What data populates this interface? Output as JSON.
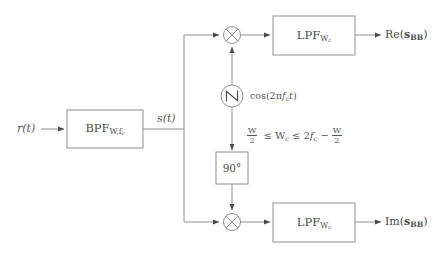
{
  "diagram": {
    "background_color": "#ffffff",
    "line_color": "#808080",
    "text_color": "#4a4a4a"
  },
  "inputs": {
    "r_label_main": "r",
    "r_label_arg": "(t)"
  },
  "blocks": {
    "bpf": {
      "name": "BPF",
      "subscript": "W,f",
      "sub_subscript": "c"
    },
    "phase_shift": {
      "label": "90°"
    },
    "lpf_upper": {
      "name": "LPF",
      "subscript": "W",
      "sub_subscript": "c"
    },
    "lpf_lower": {
      "name": "LPF",
      "subscript": "W",
      "sub_subscript": "c"
    }
  },
  "signals": {
    "s_of_t_main": "s",
    "s_of_t_arg": "(t)"
  },
  "oscillator": {
    "icon": "sine-wave-icon",
    "label_pre": "cos(2π",
    "label_f": "f",
    "label_sub": "c",
    "label_t": "t",
    "label_post": ")"
  },
  "constraint": {
    "full_text": "W/2 ≤ W_c ≤ 2f_c − W/2",
    "num1": "W",
    "den1": "2",
    "rel1": "≤",
    "wc_main": "W",
    "wc_sub": "c",
    "rel2": "≤",
    "two": "2",
    "f": "f",
    "f_sub": "c",
    "minus": "−",
    "num2": "W",
    "den2": "2"
  },
  "outputs": {
    "upper": {
      "prefix": "Re(",
      "sym": "s",
      "sub": "BB",
      "suffix": ")"
    },
    "lower": {
      "prefix": "Im(",
      "sym": "s",
      "sub": "BB",
      "suffix": ")"
    }
  },
  "multipliers": {
    "upper_glyph": "×",
    "lower_glyph": "×"
  }
}
